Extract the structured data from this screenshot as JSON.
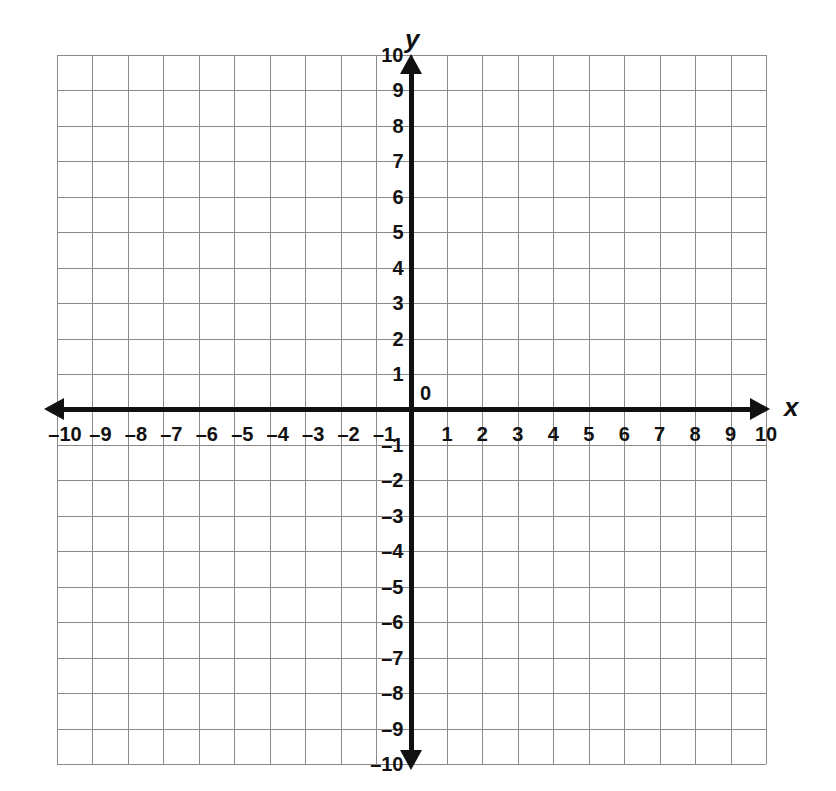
{
  "figure": {
    "kind": "cartesian-coordinate-plane",
    "background_color": "#ffffff",
    "axis_color": "#111111",
    "grid_color": "#8a8a8a"
  },
  "axes": {
    "x_name": "x",
    "y_name": "y",
    "origin_label": "0"
  },
  "ticks": {
    "x_negative": [
      "–10",
      "–9",
      "–8",
      "–7",
      "–6",
      "–5",
      "–4",
      "–3",
      "–2",
      "–1"
    ],
    "x_positive": [
      "1",
      "2",
      "3",
      "4",
      "5",
      "6",
      "7",
      "8",
      "9",
      "10"
    ],
    "y_positive": [
      "1",
      "2",
      "3",
      "4",
      "5",
      "6",
      "7",
      "8",
      "9",
      "10"
    ],
    "y_negative": [
      "–1",
      "–2",
      "–3",
      "–4",
      "–5",
      "–6",
      "–7",
      "–8",
      "–9",
      "–10"
    ]
  },
  "chart_data": {
    "type": "scatter",
    "title": "",
    "subtitle": "",
    "xlabel": "x",
    "ylabel": "y",
    "xlim": [
      -10,
      10
    ],
    "ylim": [
      -10,
      10
    ],
    "xticks": [
      -10,
      -9,
      -8,
      -7,
      -6,
      -5,
      -4,
      -3,
      -2,
      -1,
      0,
      1,
      2,
      3,
      4,
      5,
      6,
      7,
      8,
      9,
      10
    ],
    "yticks": [
      -10,
      -9,
      -8,
      -7,
      -6,
      -5,
      -4,
      -3,
      -2,
      -1,
      0,
      1,
      2,
      3,
      4,
      5,
      6,
      7,
      8,
      9,
      10
    ],
    "xticklabels": [
      "–10",
      "–9",
      "–8",
      "–7",
      "–6",
      "–5",
      "–4",
      "–3",
      "–2",
      "–1",
      "0",
      "1",
      "2",
      "3",
      "4",
      "5",
      "6",
      "7",
      "8",
      "9",
      "10"
    ],
    "yticklabels": [
      "–10",
      "–9",
      "–8",
      "–7",
      "–6",
      "–5",
      "–4",
      "–3",
      "–2",
      "–1",
      "0",
      "1",
      "2",
      "3",
      "4",
      "5",
      "6",
      "7",
      "8",
      "9",
      "10"
    ],
    "grid": true,
    "grid_step": 1,
    "legend": null,
    "series": [],
    "annotations": []
  }
}
